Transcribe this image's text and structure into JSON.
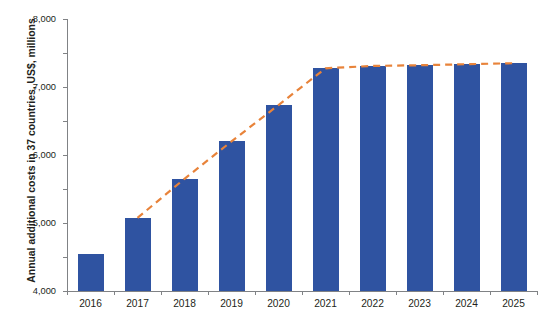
{
  "chart_title": "",
  "axis": {
    "y_title": "Annual additional costs in 37 countries, US$, millions",
    "x_title": ""
  },
  "colors": {
    "bar": "#2f53a1",
    "trend_line": "#e8833a",
    "axis": "#808285",
    "text": "#231f20"
  },
  "legend": {
    "visible": false,
    "entries": []
  },
  "chart_data": {
    "type": "bar",
    "title": "",
    "subtitle": "",
    "xlabel": "",
    "ylabel": "Annual additional costs in 37 countries, US$, millions",
    "categories": [
      "2016",
      "2017",
      "2018",
      "2019",
      "2020",
      "2021",
      "2022",
      "2023",
      "2024",
      "2025"
    ],
    "values": [
      1100,
      2150,
      3300,
      4400,
      5470,
      6550,
      6620,
      6640,
      6670,
      6700
    ],
    "ylim": [
      0,
      8000
    ],
    "ytick_labels": [
      "0",
      "1,000",
      "2,000",
      "3,000",
      "4,000",
      "5,000",
      "6,000",
      "7,000",
      "8,000"
    ],
    "ytick_values": [
      0,
      1000,
      2000,
      3000,
      4000,
      5000,
      6000,
      7000,
      8000
    ],
    "grid": false,
    "legend_position": "none",
    "series": [
      {
        "name": "Annual additional costs",
        "type": "bar",
        "color": "#2f53a1",
        "values": [
          1100,
          2150,
          3300,
          4400,
          5470,
          6550,
          6620,
          6640,
          6670,
          6700
        ]
      },
      {
        "name": "Trend",
        "type": "line",
        "style": "dashed",
        "color": "#e8833a",
        "x": [
          "2017",
          "2018",
          "2019",
          "2020",
          "2021",
          "2022",
          "2023",
          "2024",
          "2025"
        ],
        "values": [
          2150,
          3300,
          4400,
          5470,
          6550,
          6620,
          6640,
          6670,
          6700
        ]
      }
    ]
  }
}
